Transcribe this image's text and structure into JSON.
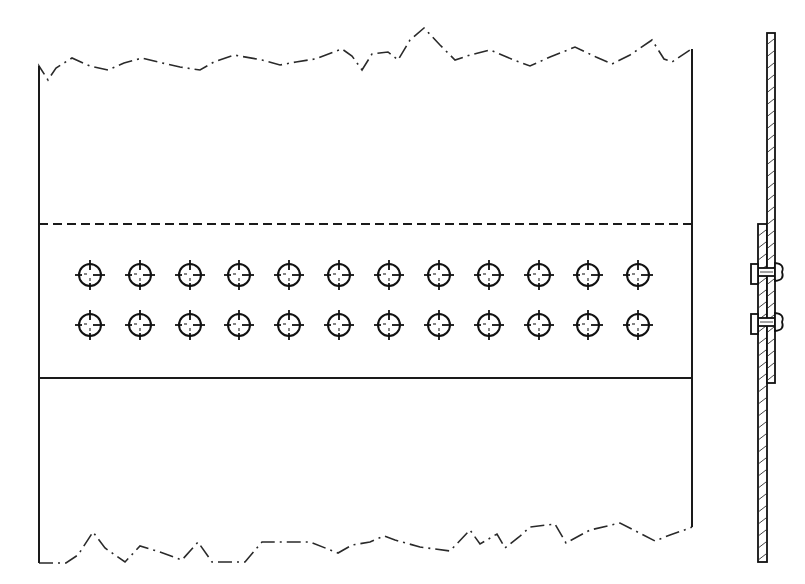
{
  "drawing": {
    "subject": "Riveted lap joint",
    "views": [
      "front-view",
      "section-view"
    ],
    "colors": {
      "ink": "#1a1a1a",
      "background": "#ffffff"
    },
    "front_view": {
      "plate_left_x": 39,
      "plate_right_x": 692,
      "top_break_y": 70,
      "bottom_break_y": 560,
      "overlap_hidden_edge_y": 224,
      "overlap_visible_edge_y": 378,
      "rivet_rows": 2,
      "rivet_columns": 12,
      "rivet_row_y": [
        275,
        325
      ],
      "rivet_column_x": [
        90,
        140,
        190,
        239,
        289,
        339,
        389,
        439,
        489,
        539,
        588,
        638
      ],
      "rivet_radius": 11,
      "top_break_points": [
        [
          39,
          70
        ],
        [
          39,
          66
        ],
        [
          48,
          80
        ],
        [
          56,
          68
        ],
        [
          72,
          58
        ],
        [
          90,
          66
        ],
        [
          108,
          70
        ],
        [
          124,
          63
        ],
        [
          142,
          58
        ],
        [
          158,
          62
        ],
        [
          180,
          67
        ],
        [
          200,
          70
        ],
        [
          214,
          62
        ],
        [
          234,
          55
        ],
        [
          262,
          60
        ],
        [
          280,
          65
        ],
        [
          296,
          62
        ],
        [
          315,
          59
        ],
        [
          342,
          49
        ],
        [
          352,
          56
        ],
        [
          362,
          70
        ],
        [
          372,
          54
        ],
        [
          388,
          52
        ],
        [
          398,
          60
        ],
        [
          410,
          40
        ],
        [
          424,
          28
        ],
        [
          440,
          45
        ],
        [
          455,
          60
        ],
        [
          470,
          55
        ],
        [
          490,
          50
        ],
        [
          514,
          60
        ],
        [
          530,
          66
        ],
        [
          550,
          57
        ],
        [
          575,
          47
        ],
        [
          596,
          57
        ],
        [
          612,
          64
        ],
        [
          630,
          55
        ],
        [
          652,
          40
        ],
        [
          664,
          59
        ],
        [
          672,
          62
        ],
        [
          690,
          50
        ],
        [
          692,
          49
        ]
      ],
      "bottom_break_points": [
        [
          39,
          563
        ],
        [
          66,
          563
        ],
        [
          78,
          555
        ],
        [
          93,
          532
        ],
        [
          105,
          548
        ],
        [
          125,
          562
        ],
        [
          140,
          546
        ],
        [
          160,
          552
        ],
        [
          182,
          560
        ],
        [
          198,
          542
        ],
        [
          212,
          562
        ],
        [
          245,
          562
        ],
        [
          262,
          542
        ],
        [
          310,
          542
        ],
        [
          338,
          553
        ],
        [
          352,
          545
        ],
        [
          370,
          542
        ],
        [
          384,
          536
        ],
        [
          395,
          540
        ],
        [
          420,
          547
        ],
        [
          450,
          551
        ],
        [
          470,
          530
        ],
        [
          480,
          544
        ],
        [
          497,
          534
        ],
        [
          505,
          548
        ],
        [
          519,
          537
        ],
        [
          530,
          527
        ],
        [
          555,
          524
        ],
        [
          566,
          543
        ],
        [
          590,
          530
        ],
        [
          620,
          523
        ],
        [
          655,
          541
        ],
        [
          670,
          535
        ],
        [
          690,
          528
        ],
        [
          692,
          527
        ]
      ]
    },
    "section_view": {
      "upper_plate": {
        "x_left": 767,
        "x_right": 775,
        "y_top": 33,
        "y_bottom": 383
      },
      "lower_plate": {
        "x_left": 758,
        "x_right": 767,
        "y_top": 224,
        "y_bottom": 562
      },
      "rivets": [
        {
          "y": 272,
          "head_flat_x": 751,
          "head_dome_x": 782
        },
        {
          "y": 322,
          "head_flat_x": 751,
          "head_dome_x": 782
        }
      ],
      "hatch_spacing": 12
    }
  }
}
